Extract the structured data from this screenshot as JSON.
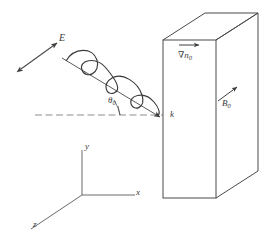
{
  "figure": {
    "stroke_color": "#4a4a4a",
    "background": "#ffffff",
    "width": 272,
    "height": 243
  },
  "labels": {
    "electric_field": "E",
    "incidence_angle": "θ",
    "incidence_angle_sub": "0",
    "wavevector": "k",
    "density_gradient_nabla": "∇",
    "density_gradient_n": "n",
    "density_gradient_sub": "0",
    "magnetic_field": "B",
    "magnetic_field_sub": "0",
    "axis_y": "y",
    "axis_x": "x",
    "axis_z": "z"
  },
  "elements": {
    "wave": {
      "name": "sinusoidal-wave",
      "cycles": 3,
      "amplitude": 14,
      "ray_start_x": 62,
      "ray_start_y": 58,
      "ray_end_x": 163,
      "ray_end_y": 118
    },
    "e_arrow": {
      "name": "double-headed-arrow",
      "x1": 21,
      "y1": 69,
      "x2": 57,
      "y2": 43
    },
    "reference_line": {
      "name": "dashed-horizontal-reference",
      "x1": 35,
      "y1": 115,
      "x2": 163,
      "y2": 115
    },
    "slab": {
      "name": "plasma-slab-box",
      "front_left": 163,
      "front_right": 216,
      "front_top": 40,
      "front_bottom": 198,
      "depth_dx": 42,
      "depth_dy": -27
    },
    "gradient_arrow": {
      "x1": 179,
      "y1": 45,
      "x2": 198,
      "y2": 45
    },
    "b_arrow": {
      "x1": 219,
      "y1": 100,
      "x2": 236,
      "y2": 88
    },
    "axes": {
      "origin_x": 82,
      "origin_y": 195,
      "y_tip_x": 82,
      "y_tip_y": 150,
      "x_tip_x": 135,
      "x_tip_y": 195,
      "z_tip_x": 31,
      "z_tip_y": 229
    }
  }
}
